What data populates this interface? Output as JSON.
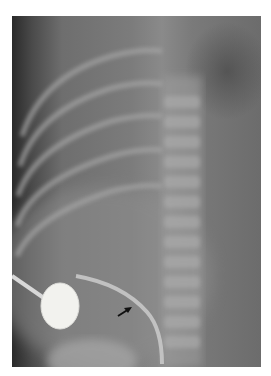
{
  "image": {
    "type": "radiograph",
    "description": "Grayscale X-ray of pediatric chest/abdomen showing ribs, spine, a circular radiopaque electrode with lead wire, a curved catheter line, and a black arrow pointing at the catheter",
    "annotation": {
      "type": "arrow",
      "color": "#111111"
    },
    "colors": {
      "background": "#ffffff",
      "film_dark": "#2a2a2a",
      "film_mid": "#7c7c7c",
      "bone": "#b8b8b8",
      "electrode": "#f2f2ee"
    }
  }
}
